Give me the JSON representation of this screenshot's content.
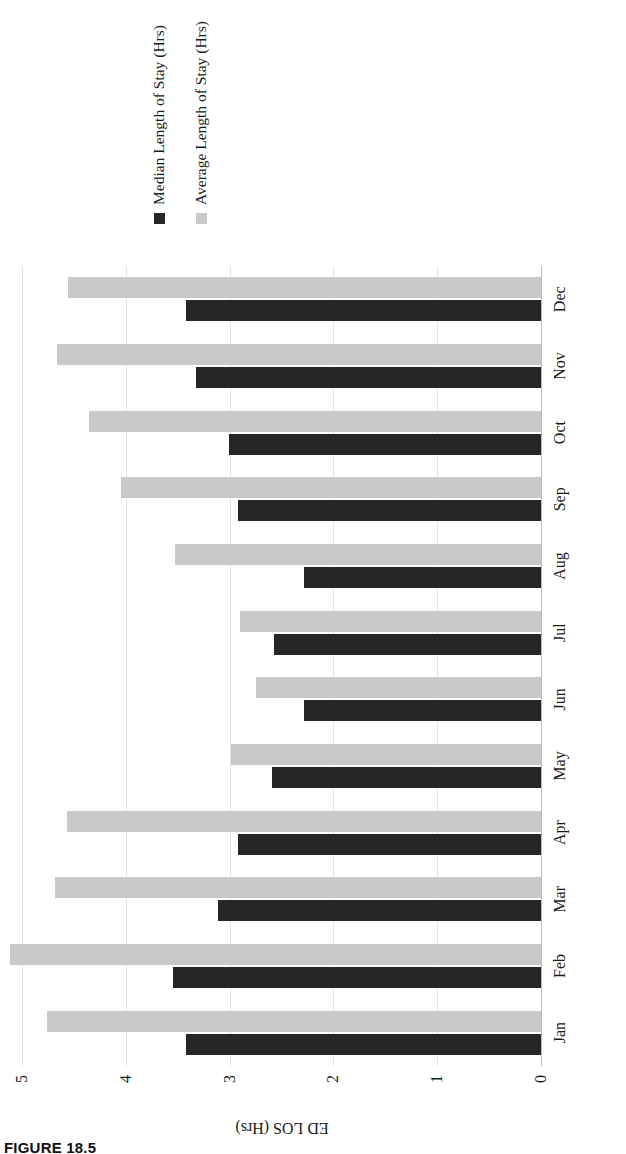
{
  "figure": {
    "caption": "FIGURE 18.5"
  },
  "legend": {
    "position": "right",
    "items": [
      {
        "label": "Median Length of Stay (Hrs)",
        "color": "#262626",
        "key": "median"
      },
      {
        "label": "Average Length of Stay (Hrs)",
        "color": "#c9c9c9",
        "key": "average"
      }
    ]
  },
  "axes": {
    "value_axis_title": "ED LOS (Hrs)",
    "value_ticks": [
      "0",
      "1",
      "2",
      "3",
      "4",
      "5"
    ],
    "category_labels": [
      "Jan",
      "Feb",
      "Mar",
      "Apr",
      "May",
      "Jun",
      "Jul",
      "Aug",
      "Sep",
      "Oct",
      "Nov",
      "Dec"
    ]
  },
  "chart_data": {
    "type": "bar",
    "title": "",
    "xlabel": "",
    "ylabel": "ED LOS (Hrs)",
    "ylim": [
      0,
      5
    ],
    "yticks": [
      0,
      1,
      2,
      3,
      4,
      5
    ],
    "grid": true,
    "orientation": "vertical",
    "legend_position": "right",
    "categories": [
      "Jan",
      "Feb",
      "Mar",
      "Apr",
      "May",
      "Jun",
      "Jul",
      "Aug",
      "Sep",
      "Oct",
      "Nov",
      "Dec"
    ],
    "series": [
      {
        "name": "Median Length of Stay (Hrs)",
        "color": "#262626",
        "values": [
          3.42,
          3.55,
          3.11,
          2.92,
          2.59,
          2.28,
          2.57,
          2.28,
          2.92,
          3.01,
          3.32,
          3.42
        ]
      },
      {
        "name": "Average Length of Stay (Hrs)",
        "color": "#c9c9c9",
        "values": [
          4.76,
          5.12,
          4.68,
          4.57,
          2.99,
          2.75,
          2.9,
          3.53,
          4.05,
          4.35,
          4.66,
          4.56
        ]
      }
    ]
  }
}
